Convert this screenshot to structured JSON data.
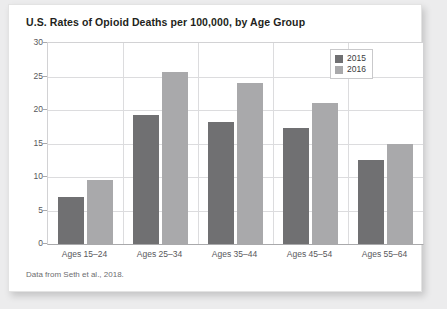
{
  "chart_data": {
    "type": "bar",
    "title": "U.S. Rates of Opioid Deaths per 100,000, by Age Group",
    "xlabel": "",
    "ylabel": "",
    "ylim": [
      0,
      30
    ],
    "yticks": [
      0,
      5,
      10,
      15,
      20,
      25,
      30
    ],
    "grid": true,
    "legend_position": "top-right",
    "categories": [
      "Ages 15–24",
      "Ages 25–34",
      "Ages 35–44",
      "Ages 45–54",
      "Ages 55–64"
    ],
    "series": [
      {
        "name": "2015",
        "color": "#707072",
        "values": [
          7.0,
          19.2,
          18.2,
          17.3,
          12.6
        ]
      },
      {
        "name": "2016",
        "color": "#a9a9ab",
        "values": [
          9.5,
          25.7,
          24.0,
          21.0,
          15.0
        ]
      }
    ],
    "source_note": "Data from Seth et al., 2018."
  },
  "legend": {
    "items": [
      {
        "label": "2015"
      },
      {
        "label": "2016"
      }
    ]
  }
}
